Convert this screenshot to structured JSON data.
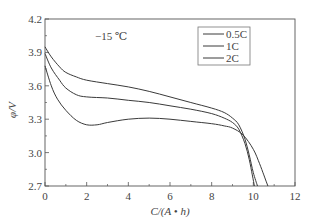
{
  "chart_data": {
    "type": "line",
    "title": "",
    "annotation": "−15 ℃",
    "xlabel": "C/(A • h)",
    "ylabel": "φ/V",
    "xlim": [
      0,
      12
    ],
    "ylim": [
      2.7,
      4.2
    ],
    "xticks": [
      "0",
      "2",
      "4",
      "6",
      "8",
      "10",
      "12"
    ],
    "yticks": [
      "2.7",
      "3.0",
      "3.3",
      "3.6",
      "3.9",
      "4.2"
    ],
    "grid": false,
    "legend_position": "upper right",
    "series": [
      {
        "name": "0.5C",
        "x": [
          0,
          0.3,
          0.7,
          1,
          1.5,
          2,
          3,
          4,
          5,
          6,
          7,
          8,
          8.6,
          9,
          9.3,
          9.6,
          9.8,
          10.0,
          10.2
        ],
        "y": [
          3.95,
          3.86,
          3.77,
          3.72,
          3.68,
          3.65,
          3.62,
          3.59,
          3.55,
          3.5,
          3.45,
          3.4,
          3.36,
          3.31,
          3.25,
          3.12,
          2.98,
          2.82,
          2.7
        ]
      },
      {
        "name": "1C",
        "x": [
          0,
          0.3,
          0.7,
          1,
          1.5,
          2,
          3,
          4,
          5,
          6,
          7,
          8,
          8.6,
          9,
          9.3,
          9.6,
          9.8,
          9.95,
          10.05
        ],
        "y": [
          3.89,
          3.76,
          3.65,
          3.58,
          3.52,
          3.5,
          3.49,
          3.47,
          3.45,
          3.42,
          3.39,
          3.35,
          3.31,
          3.27,
          3.21,
          3.08,
          2.94,
          2.8,
          2.7
        ]
      },
      {
        "name": "2C",
        "x": [
          0,
          0.3,
          0.6,
          1,
          1.5,
          2,
          2.5,
          3,
          4,
          5,
          6,
          7,
          8,
          8.6,
          9,
          9.5,
          10,
          10.3,
          10.5,
          10.7
        ],
        "y": [
          3.78,
          3.6,
          3.48,
          3.38,
          3.29,
          3.25,
          3.25,
          3.27,
          3.3,
          3.31,
          3.3,
          3.28,
          3.26,
          3.24,
          3.22,
          3.16,
          3.03,
          2.9,
          2.8,
          2.7
        ]
      }
    ]
  },
  "style": {
    "line_color": "#3a3a3a",
    "axis_color": "#555555"
  }
}
